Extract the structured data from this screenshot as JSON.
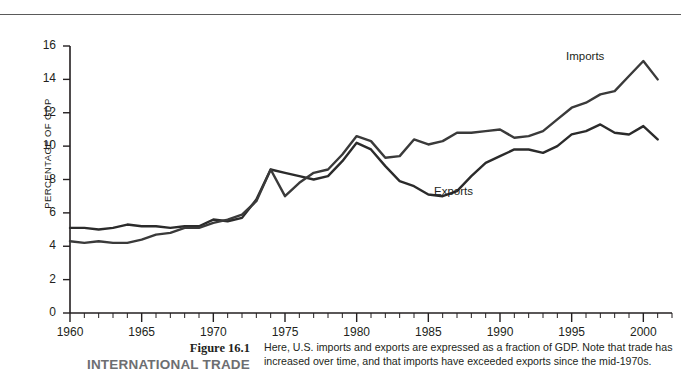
{
  "figure": {
    "number": "Figure 16.1",
    "title": "INTERNATIONAL TRADE",
    "caption_line_1": "Here, U.S. imports and exports are expressed as a fraction of GDP. Note that trade has",
    "caption_line_2": "increased over time, and that imports have exceeded exports since the mid-1970s."
  },
  "labels": {
    "imports": "Imports",
    "exports": "Exports"
  },
  "colors": {
    "imports_line": "#3a3a3a",
    "exports_line": "#2b2b2b",
    "axis": "#231f20",
    "rule": "#5a5a5a",
    "title_gray": "#6d6e71",
    "background": "#ffffff"
  },
  "chart_data": {
    "type": "line",
    "title": "",
    "xlabel": "",
    "ylabel": "PERCENTAGE OF GDP",
    "xlim": [
      1960,
      2002
    ],
    "ylim": [
      0,
      16
    ],
    "ytick_step": 2,
    "grid": false,
    "legend": "inline-annotations",
    "x_major_ticks": [
      1960,
      1965,
      1970,
      1975,
      1980,
      1985,
      1990,
      1995,
      2000
    ],
    "x_minor_tick_step": 1,
    "y_ticks": [
      0,
      2,
      4,
      6,
      8,
      10,
      12,
      14,
      16
    ],
    "x": [
      1960,
      1961,
      1962,
      1963,
      1964,
      1965,
      1966,
      1967,
      1968,
      1969,
      1970,
      1971,
      1972,
      1973,
      1974,
      1975,
      1976,
      1977,
      1978,
      1979,
      1980,
      1981,
      1982,
      1983,
      1984,
      1985,
      1986,
      1987,
      1988,
      1989,
      1990,
      1991,
      1992,
      1993,
      1994,
      1995,
      1996,
      1997,
      1998,
      1999,
      2000,
      2001
    ],
    "series": [
      {
        "name": "Exports",
        "values": [
          5.1,
          5.1,
          5.0,
          5.1,
          5.3,
          5.2,
          5.2,
          5.1,
          5.2,
          5.2,
          5.6,
          5.5,
          5.7,
          6.8,
          8.6,
          8.4,
          8.2,
          8.0,
          8.2,
          9.1,
          10.2,
          9.8,
          8.8,
          7.9,
          7.6,
          7.1,
          7.0,
          7.3,
          8.2,
          9.0,
          9.4,
          9.8,
          9.8,
          9.6,
          10.0,
          10.7,
          10.9,
          11.3,
          10.8,
          10.7,
          11.2,
          10.4
        ]
      },
      {
        "name": "Imports",
        "values": [
          4.3,
          4.2,
          4.3,
          4.2,
          4.2,
          4.4,
          4.7,
          4.8,
          5.1,
          5.1,
          5.4,
          5.6,
          5.9,
          6.7,
          8.6,
          7.0,
          7.8,
          8.4,
          8.6,
          9.5,
          10.6,
          10.3,
          9.3,
          9.4,
          10.4,
          10.1,
          10.3,
          10.8,
          10.8,
          10.9,
          11.0,
          10.5,
          10.6,
          10.9,
          11.6,
          12.3,
          12.6,
          13.1,
          13.3,
          14.2,
          15.1,
          14.0
        ]
      }
    ],
    "annotations": [
      {
        "text": "Imports",
        "x": 1996,
        "y": 14.5
      },
      {
        "text": "Exports",
        "x": 1987,
        "y": 6.6
      }
    ]
  }
}
